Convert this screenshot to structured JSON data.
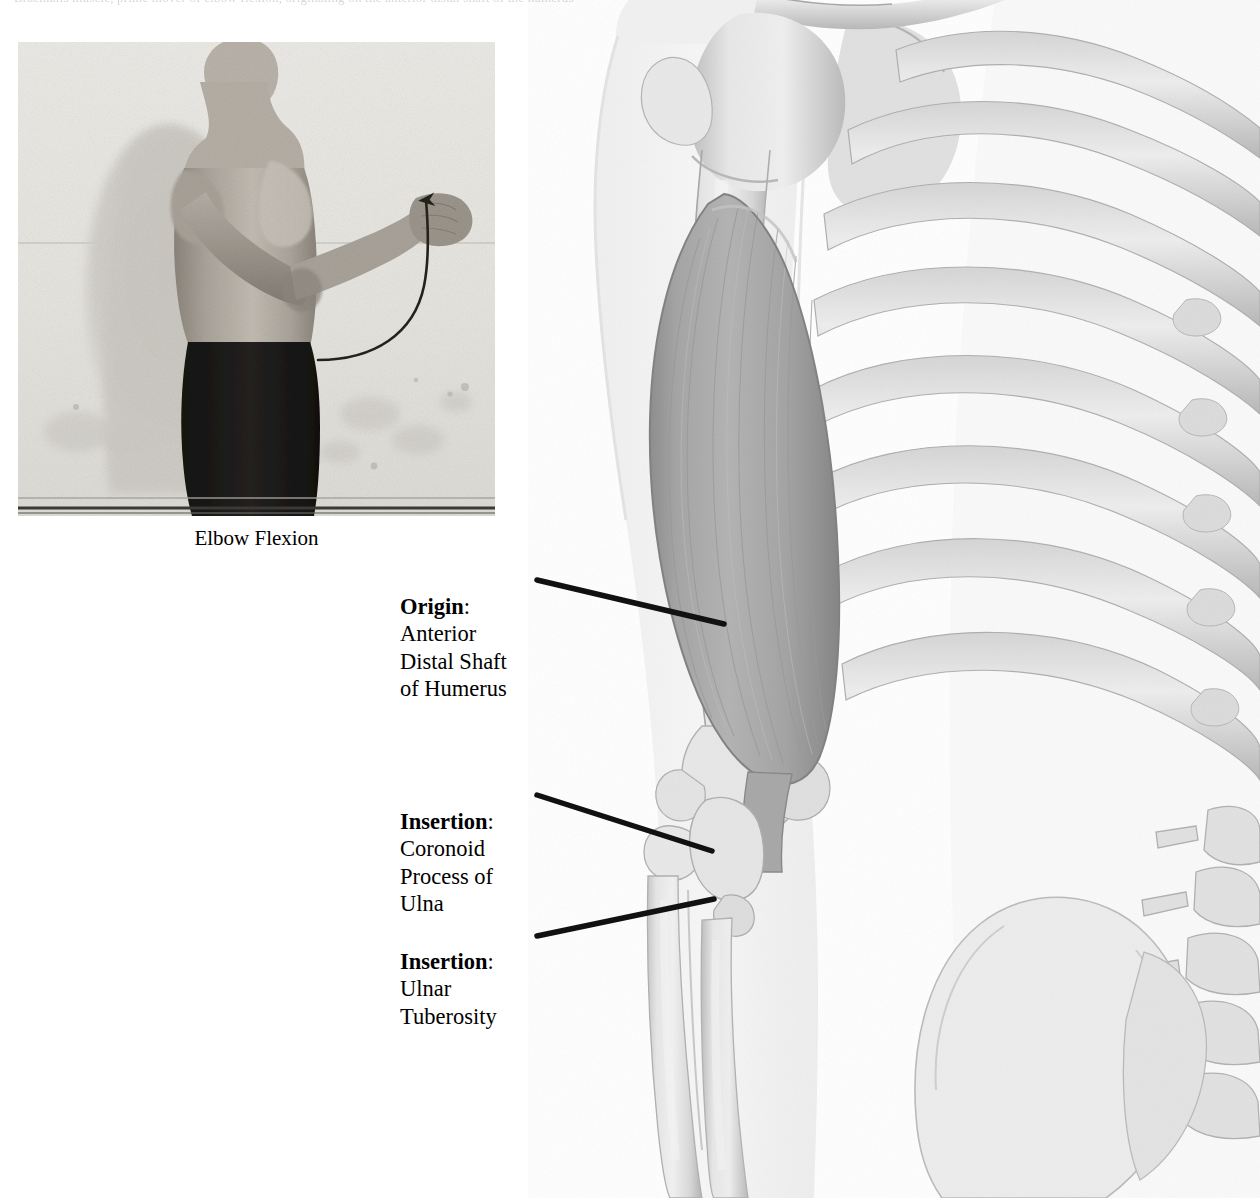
{
  "page": {
    "background_color": "#ffffff",
    "top_running_text": "Brachialis muscle, prime mover of elbow flexion, originating on the anterior distal shaft of the humerus"
  },
  "photo_figure": {
    "name": "elbow-flexion-photograph",
    "caption": "Elbow Flexion",
    "description": "Black and white photograph of a shirtless man in profile performing elbow flexion against a wall, with a curved arrow indicating the direction of motion",
    "tones": {
      "wall": "#e7e6e2",
      "shadow": "#cfcdc8",
      "skin": "#b7b2ab",
      "skin_shadow": "#8e887f",
      "shorts": "#1d1b19",
      "arrow": "#2a2724",
      "floor_line": "#3a3734"
    }
  },
  "labels": [
    {
      "id": "origin",
      "lead": "Origin",
      "colon": ":",
      "body": "Anterior\nDistal Shaft\nof Humerus",
      "target": "brachialis muscle belly"
    },
    {
      "id": "insertion-coronoid",
      "lead": "Insertion",
      "colon": ":",
      "body": "Coronoid\nProcess of\nUlna",
      "target": "coronoid process of the ulna"
    },
    {
      "id": "insertion-ulnar-tuberosity",
      "lead": "Insertion",
      "colon": ":",
      "body": "Ulnar\nTuberosity",
      "target": "ulnar tuberosity"
    }
  ],
  "leader_lines": [
    {
      "id": "leader-origin",
      "x1": 537,
      "y1": 580,
      "x2": 724,
      "y2": 624,
      "width": 5.5,
      "color": "#111111"
    },
    {
      "id": "leader-insert-1",
      "x1": 537,
      "y1": 795,
      "x2": 712,
      "y2": 851,
      "width": 5.5,
      "color": "#111111"
    },
    {
      "id": "leader-insert-2",
      "x1": 537,
      "y1": 936,
      "x2": 714,
      "y2": 899,
      "width": 5.5,
      "color": "#111111"
    }
  ],
  "anatomy": {
    "name": "upper-limb-skeleton-with-brachialis",
    "description": "Anterior view rendering of the right shoulder girdle, humerus, radius and ulna with the brachialis muscle highlighted, plus the rib cage, thoracic and lumbar spine and ilium",
    "structures": [
      "clavicle",
      "scapula",
      "acromion",
      "coracoid process",
      "humeral head",
      "greater tubercle",
      "humerus shaft",
      "medial epicondyle",
      "lateral epicondyle",
      "trochlea",
      "capitulum",
      "radial head",
      "radius",
      "ulna",
      "coronoid process",
      "ulnar tuberosity",
      "brachialis muscle",
      "ribs",
      "costal cartilage",
      "sternum",
      "thoracic vertebrae",
      "lumbar vertebrae",
      "ilium",
      "body silhouette"
    ],
    "colors": {
      "silhouette": "#f4f4f4",
      "silhouette_edge": "#e2e2e2",
      "bone_light": "#ededed",
      "bone_mid": "#d8d8d8",
      "bone_shade": "#bdbdbd",
      "bone_dark": "#9d9d9d",
      "bone_outline": "#a9a9a9",
      "muscle_light": "#b6b6b6",
      "muscle_mid": "#a3a3a3",
      "muscle_dark": "#8d8d8d",
      "muscle_edge": "#7e7e7e"
    }
  }
}
